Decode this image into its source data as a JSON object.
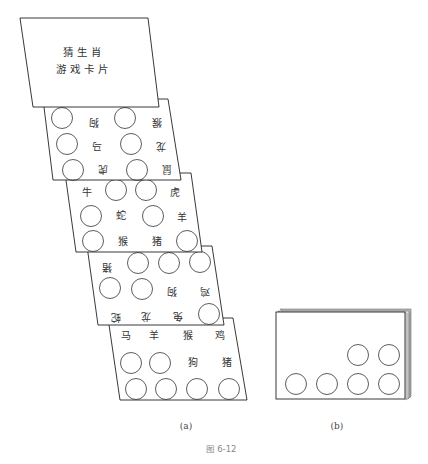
{
  "figure": {
    "number_label": "图 6-12",
    "caption_a": "(a)",
    "caption_b": "(b)"
  },
  "title_card": {
    "line1": "猜生肖",
    "line2": "游戏卡片"
  },
  "cards": [
    {
      "id": "card-2",
      "orientation": "upside-down",
      "labels": [
        "狗",
        "猴",
        "马",
        "龙",
        "虎",
        "鼠"
      ]
    },
    {
      "id": "card-3",
      "orientation": "upright",
      "labels": [
        "牛",
        "虎",
        "蛇",
        "羊",
        "猴",
        "猪"
      ]
    },
    {
      "id": "card-4",
      "orientation": "upside-down",
      "labels": [
        "猪",
        "狗",
        "鸡",
        "蛇",
        "龙",
        "兔"
      ]
    },
    {
      "id": "card-5",
      "orientation": "upright",
      "labels": [
        "马",
        "羊",
        "猴",
        "鸡",
        "狗",
        "猪"
      ]
    }
  ],
  "stacked_deck": {
    "hole_count": 6
  }
}
